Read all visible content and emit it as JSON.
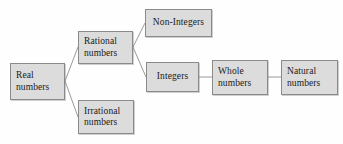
{
  "diagram": {
    "type": "tree",
    "background_color": "#fefefe",
    "node_fill_color": "#dcdcdc",
    "node_border_color": "#8a8a8a",
    "connector_color": "#9a9a9a",
    "text_color": "#1a1a1a",
    "nodes": [
      {
        "id": "real",
        "label": "Real numbers",
        "line1": "Real",
        "line2": "numbers",
        "x": 10,
        "y": 63,
        "width": 55,
        "height": 37
      },
      {
        "id": "rational",
        "label": "Rational numbers",
        "line1": "Rational",
        "line2": "numbers",
        "x": 78,
        "y": 31,
        "width": 55,
        "height": 33
      },
      {
        "id": "irrational",
        "label": "Irrational numbers",
        "line1": "Irrational",
        "line2": "numbers",
        "x": 78,
        "y": 100,
        "width": 56,
        "height": 34
      },
      {
        "id": "non-integers",
        "label": "Non-Integers",
        "line1": "Non-Integers",
        "line2": "",
        "x": 145,
        "y": 9,
        "width": 67,
        "height": 28
      },
      {
        "id": "integers",
        "label": "Integers",
        "line1": "Integers",
        "line2": "",
        "x": 146,
        "y": 62,
        "width": 53,
        "height": 30
      },
      {
        "id": "whole",
        "label": "Whole numbers",
        "line1": "Whole",
        "line2": "numbers",
        "x": 212,
        "y": 60,
        "width": 56,
        "height": 35
      },
      {
        "id": "natural",
        "label": "Natural numbers",
        "line1": "Natural",
        "line2": "numbers",
        "x": 281,
        "y": 60,
        "width": 57,
        "height": 35
      }
    ],
    "edges": [
      {
        "from": "real",
        "to": "rational",
        "kind": "diagonal",
        "x1": 65,
        "y1": 81,
        "x2": 78,
        "y2": 47
      },
      {
        "from": "real",
        "to": "irrational",
        "kind": "diagonal",
        "x1": 65,
        "y1": 81,
        "x2": 78,
        "y2": 117
      },
      {
        "from": "rational",
        "to": "non-integers",
        "kind": "diagonal",
        "x1": 133,
        "y1": 47,
        "x2": 145,
        "y2": 23
      },
      {
        "from": "rational",
        "to": "integers",
        "kind": "diagonal",
        "x1": 133,
        "y1": 47,
        "x2": 146,
        "y2": 77
      },
      {
        "from": "integers",
        "to": "whole",
        "kind": "horizontal",
        "x1": 199,
        "y1": 77,
        "x2": 212,
        "y2": 77
      },
      {
        "from": "whole",
        "to": "natural",
        "kind": "horizontal",
        "x1": 268,
        "y1": 77,
        "x2": 281,
        "y2": 77
      }
    ]
  }
}
